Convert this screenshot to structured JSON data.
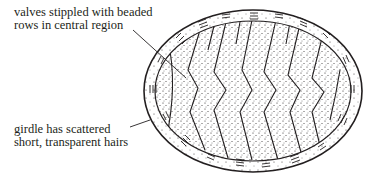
{
  "figure": {
    "labels": [
      {
        "id": "valves",
        "lines": [
          "valves stippled with beaded",
          "rows in central region"
        ]
      },
      {
        "id": "girdle",
        "lines": [
          "girdle has scattered",
          "short, transparent hairs"
        ]
      }
    ],
    "valve_count": 8,
    "colors": {
      "ink": "#231f20",
      "background": "#ffffff"
    }
  }
}
